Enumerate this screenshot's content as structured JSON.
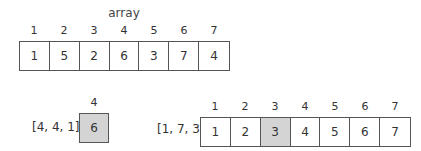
{
  "colors": {
    "highlight": "#d4d4d4",
    "border": "#555555",
    "text": "#333333"
  },
  "top_array": {
    "title": "array",
    "indices": [
      "1",
      "2",
      "3",
      "4",
      "5",
      "6",
      "7"
    ],
    "values": [
      "1",
      "5",
      "2",
      "6",
      "3",
      "7",
      "4"
    ]
  },
  "single": {
    "tuple": "[4, 4, 1]",
    "index": "4",
    "value": "6"
  },
  "bottom_array": {
    "tuple": "[1, 7, 3]",
    "indices": [
      "1",
      "2",
      "3",
      "4",
      "5",
      "6",
      "7"
    ],
    "values": [
      "1",
      "2",
      "3",
      "4",
      "5",
      "6",
      "7"
    ],
    "highlight_index": 2
  }
}
